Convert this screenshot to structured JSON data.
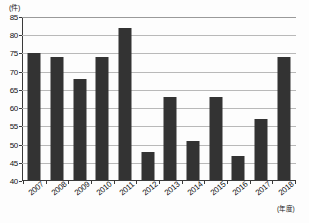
{
  "chart_data": {
    "type": "bar",
    "title": "",
    "subtitle": "",
    "xlabel": "(年度)",
    "ylabel": "(件)",
    "categories": [
      "2007",
      "2008",
      "2009",
      "2010",
      "2011",
      "2012",
      "2013",
      "2014",
      "2015",
      "2016",
      "2017",
      "2018"
    ],
    "values": [
      75,
      74,
      68,
      74,
      82,
      48,
      63,
      51,
      63,
      47,
      57,
      74
    ],
    "series": [
      {
        "name": "件数",
        "values": [
          75,
          74,
          68,
          74,
          82,
          48,
          63,
          51,
          63,
          47,
          57,
          74
        ]
      }
    ],
    "ylim": [
      40,
      85
    ],
    "ytick_step": 5,
    "ytick_labels": [
      "85",
      "80",
      "75",
      "70",
      "65",
      "60",
      "55",
      "50",
      "45",
      "40"
    ],
    "ytick_values": [
      85,
      80,
      75,
      70,
      65,
      60,
      55,
      50,
      45,
      40
    ],
    "grid": true,
    "grid_axis": "y",
    "legend": false,
    "legend_position": "none",
    "bar_color": "#333333",
    "gridline_color": "#b9b9b9",
    "axis_color": "#3a3a3a",
    "background_color": "#fdfdfd"
  }
}
